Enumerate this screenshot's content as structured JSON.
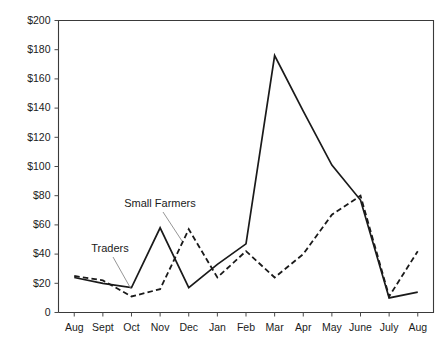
{
  "chart_data": {
    "type": "line",
    "title": "",
    "subtitle": "",
    "xlabel": "",
    "ylabel": "",
    "categories": [
      "Aug",
      "Sept",
      "Oct",
      "Nov",
      "Dec",
      "Jan",
      "Feb",
      "Mar",
      "Apr",
      "May",
      "June",
      "July",
      "Aug"
    ],
    "ylim": [
      0,
      200
    ],
    "ytick_values": [
      0,
      20,
      40,
      60,
      80,
      100,
      120,
      140,
      160,
      180,
      200
    ],
    "ytick_labels": [
      "0",
      "$20",
      "$40",
      "$60",
      "$80",
      "$100",
      "$120",
      "$140",
      "$160",
      "$180",
      "$200"
    ],
    "grid": false,
    "legend_position": "inline-annotation",
    "series": [
      {
        "name": "Traders",
        "style": "solid",
        "color": "#1a1a1a",
        "values": [
          24,
          20,
          17,
          58,
          17,
          33,
          47,
          176,
          138,
          101,
          77,
          10,
          14
        ]
      },
      {
        "name": "Small Farmers",
        "style": "dashed",
        "color": "#1a1a1a",
        "values": [
          25,
          22,
          11,
          16,
          57,
          24,
          42,
          24,
          40,
          67,
          80,
          11,
          42
        ]
      }
    ],
    "annotations": [
      {
        "text": "Traders",
        "target_series": "Traders"
      },
      {
        "text": "Small Farmers",
        "target_series": "Small Farmers"
      }
    ]
  },
  "axis": {
    "y_labels": [
      "$200",
      "$180",
      "$160",
      "$140",
      "$120",
      "$100",
      "$80",
      "$60",
      "$40",
      "$20",
      "0"
    ],
    "x_labels": [
      "Aug",
      "Sept",
      "Oct",
      "Nov",
      "Dec",
      "Jan",
      "Feb",
      "Mar",
      "Apr",
      "May",
      "June",
      "July",
      "Aug"
    ]
  },
  "annotations": {
    "traders_label": "Traders",
    "small_farmers_label": "Small Farmers"
  },
  "colors": {
    "background": "#ffffff",
    "line": "#1a1a1a",
    "axis": "#3a3a3a",
    "text": "#1b1b1b",
    "leader": "#8a8a8a"
  }
}
